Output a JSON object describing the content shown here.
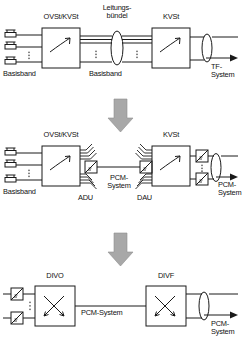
{
  "diagram": {
    "title_semantic": "evolution-of-telephone-network-transmission",
    "stroke_color": "#1a1a1a",
    "arrow_color": "#a0a0a0",
    "stages": [
      {
        "id": "stage-analog",
        "labels": {
          "exchange_left": "OVSt/KVSt",
          "trunk_group": "Leitungs-\nbündel",
          "exchange_right": "KVSt",
          "baseband_left": "Basisband",
          "baseband_mid": "Basisband",
          "output": "TF-\nSystem"
        }
      },
      {
        "id": "stage-pcm-transition",
        "labels": {
          "exchange_left": "OVSt/KVSt",
          "exchange_right": "KVSt",
          "baseband_left": "Basisband",
          "converter_left": "ADU",
          "link": "PCM-\nSystem",
          "converter_right": "DAU",
          "output": "PCM-\nSystem"
        }
      },
      {
        "id": "stage-digital",
        "labels": {
          "exchange_left": "DIVO",
          "exchange_right": "DIVF",
          "link": "PCM-System",
          "output": "PCM-\nSystem"
        }
      }
    ],
    "flow_arrows": [
      {
        "name": "flow-arrow-1"
      },
      {
        "name": "flow-arrow-2"
      }
    ]
  }
}
